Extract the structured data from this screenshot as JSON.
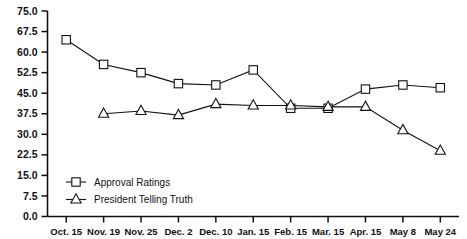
{
  "chart_data": {
    "type": "line",
    "title": "",
    "xlabel": "",
    "ylabel": "",
    "categories": [
      "Oct. 15",
      "Nov. 19",
      "Nov. 25",
      "Dec. 2",
      "Dec. 10",
      "Jan. 15",
      "Feb. 15",
      "Mar. 15",
      "Apr. 15",
      "May 8",
      "May 24"
    ],
    "series": [
      {
        "name": "Approval Ratings",
        "marker": "square",
        "values": [
          64.5,
          55.5,
          52.5,
          48.5,
          48.0,
          53.5,
          39.5,
          39.5,
          46.5,
          48.0,
          47.0
        ]
      },
      {
        "name": "President Telling Truth",
        "marker": "triangle",
        "values": [
          null,
          37.5,
          38.5,
          37.0,
          41.0,
          40.5,
          40.5,
          40.0,
          40.0,
          31.5,
          24.0
        ]
      }
    ],
    "ylim": [
      0.0,
      75.0
    ],
    "ytick_values": [
      0.0,
      7.5,
      15.0,
      22.5,
      30.0,
      37.5,
      45.0,
      52.5,
      60.0,
      67.5,
      75.0
    ],
    "ytick_labels": [
      "0.0",
      "7.5",
      "15.0",
      "22.5",
      "30.0",
      "37.5",
      "45.0",
      "52.5",
      "60.0",
      "67.5",
      "75.0"
    ],
    "grid": false,
    "legend_position": "inside-lower-left",
    "legend": [
      {
        "label": "Approval Ratings",
        "marker": "square"
      },
      {
        "label": "President Telling Truth",
        "marker": "triangle"
      }
    ],
    "colors": {
      "line": "#111111",
      "marker_fill": "#ffffff",
      "axis": "#111111",
      "background": "#ffffff"
    }
  }
}
